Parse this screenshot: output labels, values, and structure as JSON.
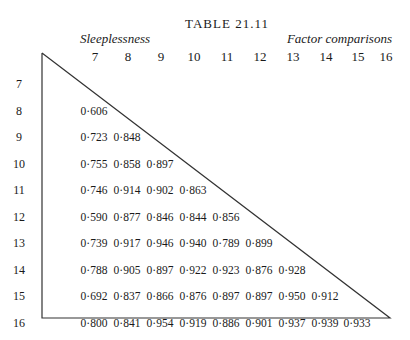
{
  "table": {
    "title": "TABLE 21.11",
    "subtitle_left": "Sleeplessness",
    "subtitle_right": "Factor comparisons",
    "columns": [
      "7",
      "8",
      "9",
      "10",
      "11",
      "12",
      "13",
      "14",
      "15",
      "16"
    ],
    "rows": [
      {
        "label": "7",
        "values": []
      },
      {
        "label": "8",
        "values": [
          "0·606"
        ]
      },
      {
        "label": "9",
        "values": [
          "0·723",
          "0·848"
        ]
      },
      {
        "label": "10",
        "values": [
          "0·755",
          "0·858",
          "0·897"
        ]
      },
      {
        "label": "11",
        "values": [
          "0·746",
          "0·914",
          "0·902",
          "0·863"
        ]
      },
      {
        "label": "12",
        "values": [
          "0·590",
          "0·877",
          "0·846",
          "0·844",
          "0·856"
        ]
      },
      {
        "label": "13",
        "values": [
          "0·739",
          "0·917",
          "0·946",
          "0·940",
          "0·789",
          "0·899"
        ]
      },
      {
        "label": "14",
        "values": [
          "0·788",
          "0·905",
          "0·897",
          "0·922",
          "0·923",
          "0·876",
          "0·928"
        ]
      },
      {
        "label": "15",
        "values": [
          "0·692",
          "0·837",
          "0·866",
          "0·876",
          "0·897",
          "0·897",
          "0·950",
          "0·912"
        ]
      },
      {
        "label": "16",
        "values": [
          "0·800",
          "0·841",
          "0·954",
          "0·919",
          "0·886",
          "0·901",
          "0·937",
          "0·939",
          "0·933"
        ]
      }
    ]
  }
}
